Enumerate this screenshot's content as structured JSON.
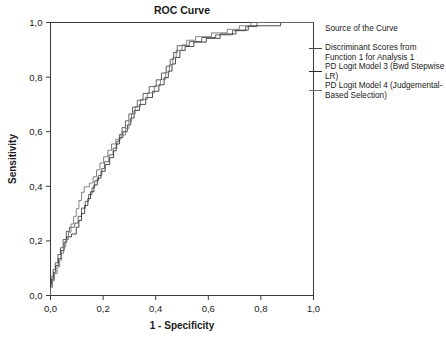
{
  "chart_data": {
    "type": "line",
    "title": "ROC Curve",
    "xlabel": "1 - Specificity",
    "ylabel": "Sensitivity",
    "xlim": [
      0,
      1
    ],
    "ylim": [
      0,
      1
    ],
    "grid": false,
    "legend_position": "right",
    "legend_title": "Source of the Curve",
    "xticks": [
      "0,0",
      "0,2",
      "0,4",
      "0,6",
      "0,8",
      "1,0"
    ],
    "xtick_values": [
      0,
      0.2,
      0.4,
      0.6,
      0.8,
      1
    ],
    "yticks": [
      "0,0",
      "0,2",
      "0,4",
      "0,6",
      "0,8",
      "1,0"
    ],
    "ytick_values": [
      0,
      0.2,
      0.4,
      0.6,
      0.8,
      1
    ],
    "series": [
      {
        "name": "Discriminant Scores from Function 1 for Analysis 1",
        "color": "#4a4a4a",
        "points": [
          [
            0.0,
            0.0
          ],
          [
            0.0,
            0.045
          ],
          [
            0.005,
            0.045
          ],
          [
            0.005,
            0.07
          ],
          [
            0.01,
            0.07
          ],
          [
            0.01,
            0.095
          ],
          [
            0.018,
            0.095
          ],
          [
            0.018,
            0.12
          ],
          [
            0.028,
            0.12
          ],
          [
            0.028,
            0.15
          ],
          [
            0.038,
            0.15
          ],
          [
            0.038,
            0.175
          ],
          [
            0.048,
            0.175
          ],
          [
            0.048,
            0.205
          ],
          [
            0.06,
            0.205
          ],
          [
            0.06,
            0.235
          ],
          [
            0.072,
            0.235
          ],
          [
            0.072,
            0.25
          ],
          [
            0.092,
            0.25
          ],
          [
            0.092,
            0.265
          ],
          [
            0.105,
            0.265
          ],
          [
            0.105,
            0.29
          ],
          [
            0.118,
            0.29
          ],
          [
            0.118,
            0.32
          ],
          [
            0.132,
            0.32
          ],
          [
            0.132,
            0.345
          ],
          [
            0.145,
            0.345
          ],
          [
            0.145,
            0.37
          ],
          [
            0.158,
            0.37
          ],
          [
            0.158,
            0.395
          ],
          [
            0.168,
            0.395
          ],
          [
            0.168,
            0.42
          ],
          [
            0.182,
            0.42
          ],
          [
            0.182,
            0.44
          ],
          [
            0.195,
            0.44
          ],
          [
            0.195,
            0.465
          ],
          [
            0.205,
            0.465
          ],
          [
            0.205,
            0.49
          ],
          [
            0.222,
            0.49
          ],
          [
            0.222,
            0.515
          ],
          [
            0.238,
            0.515
          ],
          [
            0.238,
            0.54
          ],
          [
            0.252,
            0.54
          ],
          [
            0.252,
            0.565
          ],
          [
            0.262,
            0.565
          ],
          [
            0.262,
            0.59
          ],
          [
            0.272,
            0.59
          ],
          [
            0.272,
            0.615
          ],
          [
            0.285,
            0.615
          ],
          [
            0.285,
            0.64
          ],
          [
            0.298,
            0.64
          ],
          [
            0.298,
            0.665
          ],
          [
            0.312,
            0.665
          ],
          [
            0.312,
            0.69
          ],
          [
            0.33,
            0.69
          ],
          [
            0.33,
            0.715
          ],
          [
            0.352,
            0.715
          ],
          [
            0.352,
            0.74
          ],
          [
            0.375,
            0.74
          ],
          [
            0.375,
            0.765
          ],
          [
            0.402,
            0.765
          ],
          [
            0.402,
            0.79
          ],
          [
            0.422,
            0.79
          ],
          [
            0.422,
            0.815
          ],
          [
            0.44,
            0.815
          ],
          [
            0.44,
            0.84
          ],
          [
            0.455,
            0.84
          ],
          [
            0.455,
            0.865
          ],
          [
            0.468,
            0.865
          ],
          [
            0.468,
            0.89
          ],
          [
            0.482,
            0.89
          ],
          [
            0.482,
            0.915
          ],
          [
            0.528,
            0.915
          ],
          [
            0.528,
            0.93
          ],
          [
            0.575,
            0.93
          ],
          [
            0.575,
            0.945
          ],
          [
            0.628,
            0.945
          ],
          [
            0.628,
            0.955
          ],
          [
            0.692,
            0.955
          ],
          [
            0.692,
            0.97
          ],
          [
            0.742,
            0.97
          ],
          [
            0.742,
            0.985
          ],
          [
            0.785,
            0.985
          ],
          [
            0.785,
            1.0
          ],
          [
            1.0,
            1.0
          ]
        ]
      },
      {
        "name": "PD Logit Model 3 (Bwd Stepwise LR)",
        "color": "#2b2b2b",
        "points": [
          [
            0.0,
            0.0
          ],
          [
            0.0,
            0.035
          ],
          [
            0.005,
            0.035
          ],
          [
            0.005,
            0.06
          ],
          [
            0.012,
            0.06
          ],
          [
            0.012,
            0.085
          ],
          [
            0.02,
            0.085
          ],
          [
            0.02,
            0.11
          ],
          [
            0.03,
            0.11
          ],
          [
            0.03,
            0.135
          ],
          [
            0.04,
            0.135
          ],
          [
            0.04,
            0.165
          ],
          [
            0.052,
            0.165
          ],
          [
            0.052,
            0.195
          ],
          [
            0.062,
            0.195
          ],
          [
            0.062,
            0.215
          ],
          [
            0.08,
            0.215
          ],
          [
            0.08,
            0.225
          ],
          [
            0.098,
            0.225
          ],
          [
            0.098,
            0.25
          ],
          [
            0.108,
            0.25
          ],
          [
            0.108,
            0.275
          ],
          [
            0.118,
            0.275
          ],
          [
            0.118,
            0.3
          ],
          [
            0.13,
            0.3
          ],
          [
            0.13,
            0.33
          ],
          [
            0.142,
            0.33
          ],
          [
            0.142,
            0.355
          ],
          [
            0.152,
            0.355
          ],
          [
            0.152,
            0.38
          ],
          [
            0.165,
            0.38
          ],
          [
            0.165,
            0.405
          ],
          [
            0.178,
            0.405
          ],
          [
            0.178,
            0.43
          ],
          [
            0.192,
            0.43
          ],
          [
            0.192,
            0.455
          ],
          [
            0.208,
            0.455
          ],
          [
            0.208,
            0.48
          ],
          [
            0.225,
            0.48
          ],
          [
            0.225,
            0.505
          ],
          [
            0.24,
            0.505
          ],
          [
            0.24,
            0.53
          ],
          [
            0.25,
            0.53
          ],
          [
            0.25,
            0.555
          ],
          [
            0.262,
            0.555
          ],
          [
            0.262,
            0.578
          ],
          [
            0.275,
            0.578
          ],
          [
            0.275,
            0.6
          ],
          [
            0.292,
            0.6
          ],
          [
            0.292,
            0.625
          ],
          [
            0.305,
            0.625
          ],
          [
            0.305,
            0.65
          ],
          [
            0.318,
            0.65
          ],
          [
            0.318,
            0.678
          ],
          [
            0.338,
            0.678
          ],
          [
            0.338,
            0.7
          ],
          [
            0.362,
            0.7
          ],
          [
            0.362,
            0.725
          ],
          [
            0.388,
            0.725
          ],
          [
            0.388,
            0.748
          ],
          [
            0.412,
            0.748
          ],
          [
            0.412,
            0.772
          ],
          [
            0.432,
            0.772
          ],
          [
            0.432,
            0.798
          ],
          [
            0.448,
            0.798
          ],
          [
            0.448,
            0.822
          ],
          [
            0.462,
            0.822
          ],
          [
            0.462,
            0.848
          ],
          [
            0.475,
            0.848
          ],
          [
            0.475,
            0.872
          ],
          [
            0.492,
            0.872
          ],
          [
            0.492,
            0.898
          ],
          [
            0.512,
            0.898
          ],
          [
            0.512,
            0.912
          ],
          [
            0.545,
            0.912
          ],
          [
            0.545,
            0.928
          ],
          [
            0.592,
            0.928
          ],
          [
            0.592,
            0.942
          ],
          [
            0.645,
            0.942
          ],
          [
            0.645,
            0.958
          ],
          [
            0.705,
            0.958
          ],
          [
            0.705,
            0.972
          ],
          [
            0.752,
            0.972
          ],
          [
            0.752,
            0.988
          ],
          [
            0.875,
            0.988
          ],
          [
            0.875,
            1.0
          ],
          [
            1.0,
            1.0
          ]
        ]
      },
      {
        "name": "PD Logit Model 4 (Judgemental-Based Selection)",
        "color": "#6e6e6e",
        "points": [
          [
            0.0,
            0.0
          ],
          [
            0.0,
            0.03
          ],
          [
            0.008,
            0.03
          ],
          [
            0.008,
            0.055
          ],
          [
            0.015,
            0.055
          ],
          [
            0.015,
            0.08
          ],
          [
            0.025,
            0.08
          ],
          [
            0.025,
            0.105
          ],
          [
            0.035,
            0.105
          ],
          [
            0.035,
            0.13
          ],
          [
            0.042,
            0.13
          ],
          [
            0.042,
            0.155
          ],
          [
            0.05,
            0.155
          ],
          [
            0.05,
            0.178
          ],
          [
            0.058,
            0.178
          ],
          [
            0.058,
            0.205
          ],
          [
            0.068,
            0.205
          ],
          [
            0.068,
            0.232
          ],
          [
            0.078,
            0.232
          ],
          [
            0.078,
            0.262
          ],
          [
            0.088,
            0.262
          ],
          [
            0.088,
            0.29
          ],
          [
            0.098,
            0.29
          ],
          [
            0.098,
            0.318
          ],
          [
            0.108,
            0.318
          ],
          [
            0.108,
            0.348
          ],
          [
            0.118,
            0.348
          ],
          [
            0.118,
            0.378
          ],
          [
            0.128,
            0.378
          ],
          [
            0.128,
            0.398
          ],
          [
            0.148,
            0.398
          ],
          [
            0.148,
            0.412
          ],
          [
            0.162,
            0.412
          ],
          [
            0.162,
            0.435
          ],
          [
            0.175,
            0.435
          ],
          [
            0.175,
            0.46
          ],
          [
            0.188,
            0.46
          ],
          [
            0.188,
            0.485
          ],
          [
            0.202,
            0.485
          ],
          [
            0.202,
            0.508
          ],
          [
            0.218,
            0.508
          ],
          [
            0.218,
            0.532
          ],
          [
            0.232,
            0.532
          ],
          [
            0.232,
            0.555
          ],
          [
            0.248,
            0.555
          ],
          [
            0.248,
            0.572
          ],
          [
            0.268,
            0.572
          ],
          [
            0.268,
            0.588
          ],
          [
            0.285,
            0.588
          ],
          [
            0.285,
            0.612
          ],
          [
            0.298,
            0.612
          ],
          [
            0.298,
            0.638
          ],
          [
            0.308,
            0.638
          ],
          [
            0.308,
            0.665
          ],
          [
            0.322,
            0.665
          ],
          [
            0.322,
            0.692
          ],
          [
            0.342,
            0.692
          ],
          [
            0.342,
            0.718
          ],
          [
            0.368,
            0.718
          ],
          [
            0.368,
            0.742
          ],
          [
            0.395,
            0.742
          ],
          [
            0.395,
            0.768
          ],
          [
            0.418,
            0.768
          ],
          [
            0.418,
            0.792
          ],
          [
            0.438,
            0.792
          ],
          [
            0.438,
            0.818
          ],
          [
            0.452,
            0.818
          ],
          [
            0.452,
            0.845
          ],
          [
            0.465,
            0.845
          ],
          [
            0.465,
            0.872
          ],
          [
            0.478,
            0.872
          ],
          [
            0.478,
            0.898
          ],
          [
            0.5,
            0.898
          ],
          [
            0.5,
            0.918
          ],
          [
            0.518,
            0.918
          ],
          [
            0.518,
            0.935
          ],
          [
            0.552,
            0.935
          ],
          [
            0.552,
            0.948
          ],
          [
            0.612,
            0.948
          ],
          [
            0.612,
            0.962
          ],
          [
            0.672,
            0.962
          ],
          [
            0.672,
            0.975
          ],
          [
            0.718,
            0.975
          ],
          [
            0.718,
            0.988
          ],
          [
            0.762,
            0.988
          ],
          [
            0.762,
            1.0
          ],
          [
            1.0,
            1.0
          ]
        ]
      }
    ]
  },
  "legend": {
    "title": "Source of the Curve",
    "entries": [
      "Discriminant Scores from Function 1 for Analysis 1",
      "PD Logit Model 3 (Bwd Stepwise LR)",
      "PD Logit Model 4 (Judgemental-Based Selection)"
    ]
  },
  "axis_color": "#3a3a3a"
}
